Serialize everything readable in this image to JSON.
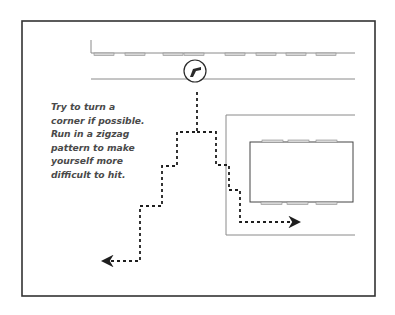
{
  "caption": {
    "lines": [
      "Try to turn a",
      "corner if possible.",
      "Run in a zigzag",
      "pattern to make",
      "yourself more",
      "difficult to hit."
    ]
  },
  "colors": {
    "frame": "#333333",
    "road_line": "#8a8a8a",
    "building_outline": "#444444",
    "window_fill": "#d8d8d8",
    "window_stroke": "#8a8a8a",
    "path": "#1e1e1e",
    "icon": "#2a2a2a",
    "text": "#4a4a4a"
  },
  "diagram": {
    "frame": {
      "x": 22,
      "y": 21,
      "w": 353,
      "h": 275
    },
    "top_road": {
      "upper_line_y": 53,
      "lower_line_y": 79,
      "x_start": 91,
      "x_end": 355,
      "stub_top_y": 40,
      "windows_x": [
        94,
        125,
        163,
        184,
        225,
        256,
        286,
        316
      ],
      "window_w": 20
    },
    "shooter_icon": {
      "name": "gun-icon",
      "cx": 195,
      "cy": 71,
      "r": 11
    },
    "right_block": {
      "outer": {
        "x": 226,
        "y": 115,
        "right": 355,
        "bottom": 235
      },
      "building": {
        "x": 250,
        "y": 142,
        "w": 103,
        "h": 60
      },
      "top_windows_x": [
        262,
        288,
        316
      ],
      "bottom_windows_x": [
        261,
        287,
        316
      ],
      "window_w": 21
    },
    "path_left": {
      "points": "197,92 197,132 177,132 177,166 162,166 162,206 140,206 140,261 106,261",
      "arrow": "left"
    },
    "path_right": {
      "points": "197,132 216,132 216,165 229,165 229,190 240,190 240,222 296,222",
      "arrow": "right"
    }
  }
}
